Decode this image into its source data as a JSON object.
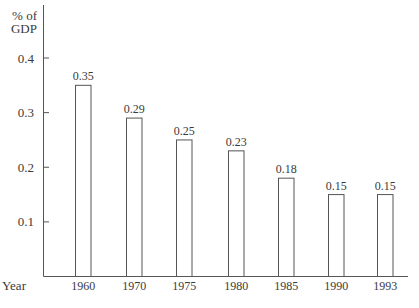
{
  "chart_data": {
    "type": "bar",
    "title": "",
    "ylabel": "% of GDP",
    "ylabel_lines": [
      "% of",
      "GDP"
    ],
    "xlabel": "Year",
    "categories": [
      "1960",
      "1970",
      "1975",
      "1980",
      "1985",
      "1990",
      "1993"
    ],
    "values": [
      0.35,
      0.29,
      0.25,
      0.23,
      0.18,
      0.15,
      0.15
    ],
    "value_labels": [
      "0.35",
      "0.29",
      "0.25",
      "0.23",
      "0.18",
      "0.15",
      "0.15"
    ],
    "yticks": [
      0.1,
      0.2,
      0.3,
      0.4
    ],
    "ytick_labels": [
      "0.1",
      "0.2",
      "0.3",
      "0.4"
    ],
    "ylim": [
      0,
      0.43
    ],
    "grid": false,
    "legend": null,
    "bar_fill": "#ffffff",
    "bar_stroke": "#555555",
    "axis_color": "#555555"
  }
}
